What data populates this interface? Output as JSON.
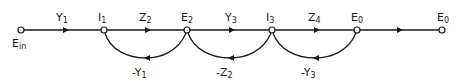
{
  "diagram": {
    "type": "signal-flow-graph",
    "colors": {
      "stroke": "#1a1a1a",
      "background": "#ffffff"
    },
    "nodes": [
      {
        "id": "Ein",
        "label": "E",
        "sub": "in",
        "x": 21,
        "y": 30
      },
      {
        "id": "I1",
        "label": "I",
        "sub": "1",
        "x": 104,
        "y": 30
      },
      {
        "id": "E2",
        "label": "E",
        "sub": "2",
        "x": 187,
        "y": 30
      },
      {
        "id": "I3",
        "label": "I",
        "sub": "3",
        "x": 272,
        "y": 30
      },
      {
        "id": "E0a",
        "label": "E",
        "sub": "0",
        "x": 357,
        "y": 30
      },
      {
        "id": "E0b",
        "label": "E",
        "sub": "0",
        "x": 442,
        "y": 30
      }
    ],
    "forward_branches": [
      {
        "from": "Ein",
        "to": "I1",
        "gain": "Y",
        "sub": "1"
      },
      {
        "from": "I1",
        "to": "E2",
        "gain": "Z",
        "sub": "2"
      },
      {
        "from": "E2",
        "to": "I3",
        "gain": "Y",
        "sub": "3"
      },
      {
        "from": "I3",
        "to": "E0a",
        "gain": "Z",
        "sub": "4"
      },
      {
        "from": "E0a",
        "to": "E0b",
        "gain": "",
        "sub": ""
      }
    ],
    "feedback_branches": [
      {
        "from": "E2",
        "to": "I1",
        "gain": "-Y",
        "sub": "1"
      },
      {
        "from": "I3",
        "to": "E2",
        "gain": "-Z",
        "sub": "2"
      },
      {
        "from": "E0a",
        "to": "I3",
        "gain": "-Y",
        "sub": "3"
      }
    ]
  }
}
